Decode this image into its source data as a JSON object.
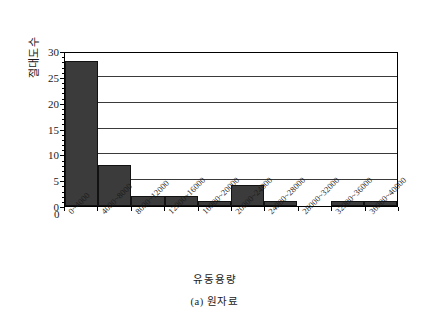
{
  "chart_data": {
    "type": "bar",
    "title": "",
    "subtitle": "",
    "xlabel": "유동용량",
    "ylabel": "절대도수",
    "caption": "(a) 원자료",
    "categories": [
      "0~4000",
      "4000~8000",
      "8000~12000",
      "12000~16000",
      "16000~20000",
      "20000~24000",
      "24000~28000",
      "28000~32000",
      "32000~36000",
      "36000~40000"
    ],
    "values": [
      28,
      8,
      2,
      2,
      1,
      4,
      1,
      0,
      1,
      1
    ],
    "ylim": [
      0,
      30
    ],
    "yticks": [
      0,
      5,
      10,
      15,
      20,
      25,
      30
    ],
    "ytick_labels": [
      "0",
      "5",
      "10",
      "15",
      "20",
      "25",
      "30"
    ],
    "x_origin_label": "0",
    "grid": true,
    "grid_axis": "y",
    "legend": null,
    "bar_color": "#3b3b3b",
    "bar_edge_color": "#121212",
    "axis_color": "#000000",
    "grid_color": "#3a3a3a",
    "background_color": "#ffffff",
    "xtick_rotation": -45
  }
}
